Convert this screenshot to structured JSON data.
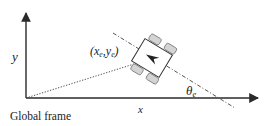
{
  "diagram": {
    "axes": {
      "x_label": "x",
      "y_label": "y",
      "frame_label": "Global frame"
    },
    "robot": {
      "position_label_open": "(",
      "position_x": "x",
      "position_x_sub": "e",
      "position_sep": ",",
      "position_y": "y",
      "position_y_sub": "e",
      "position_label_close": ")",
      "heading_symbol": "θ",
      "heading_sub": "e"
    },
    "colors": {
      "axis": "#2a2a2a",
      "wheel_fill": "#d4d4d4",
      "wheel_stroke": "#777777",
      "body_fill": "#ffffff"
    }
  }
}
